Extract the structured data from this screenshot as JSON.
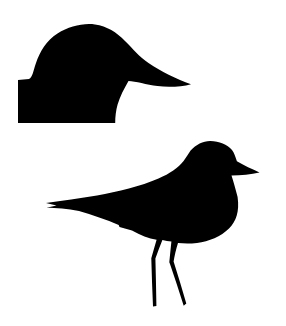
{
  "canvas": {
    "width": 286,
    "height": 326,
    "background_color": "#ffffff",
    "silhouette_color": "#000000"
  },
  "figures": {
    "duck_head": {
      "name": "duck-head-silhouette",
      "description": "Black silhouette of a duck head with a long bill pointing right, rising from a rectangular base block, upper-left of image",
      "path": "M 18 123 L 18 80 L 29 79 C 32.5 77.5 33 71.5 36 63 C 39.5 52.5 46.5 40 57.5 33.5 C 69 26.5 83 22.8 95 24.5 C 107 26.3 116.5 32 125 41 C 133.5 49.5 139 56.5 148.5 63 C 161.5 71.8 176.5 79.2 191 84.2 C 181.5 86.8 168.5 87.6 157.5 86.1 C 146.5 84.6 135.5 81.3 128.5 81 C 124.3 88.3 119.8 96.8 117.6 104.6 C 115.9 110.7 115.2 117 115.2 123 Z"
    },
    "shorebird": {
      "name": "standing-shorebird-silhouette",
      "description": "Black silhouette of a standing shorebird (plover) facing right with short bill, notched tail and two thin bent legs, lower portion of image",
      "path": "M 259.5 172.5 C 251 174.6 241 175.1 231.5 175.6 C 233.6 182 235.6 189.5 237.6 197 C 239.6 212 236.2 221 229 228.6 C 221 236.6 209 241.6 197 242.9 C 189 243.7 183 243.4 178 242.9 C 176 249.5 174.5 255.5 173.6 261.6 C 178 275.6 182.3 289.6 186.3 303.6 L 183.7 305.7 C 179.3 291.9 174.7 277.9 170 264.1 L 169.3 262.3 C 170 255.3 170.7 248.4 171.4 241.6 C 168.4 241.2 165.4 240.6 162.4 239.9 C 160 246 157.5 252.2 155.4 258.4 C 155.8 274.3 156.2 290.2 156.4 306.1 L 153 306.6 C 152.3 290.5 151.7 274.4 151.3 258.3 C 153 252 154.8 245.8 156.6 239.7 C 148.5 238.7 140.5 235.2 132 230.6 L 119.5 227.1 L 118.7 224.9 C 106.5 220.1 92 214.6 79 211.1 C 67.5 208.4 56 207.9 46.5 207.7 L 56.5 205.4 L 46 202.9 C 62 200.4 80 198.3 97 195.4 C 118 191.7 140.5 186.1 158.5 178.4 C 170 173.4 178 167.9 183.6 160.9 C 186.2 157.5 188.2 154.1 190.6 150.6 C 196 144.5 203 141.1 210 141 C 219 140.9 227.2 144.6 232 150 C 234.2 153 235.4 156.6 236.9 161.3 C 244 165.6 252 169.1 259.5 172.5 Z"
    }
  }
}
